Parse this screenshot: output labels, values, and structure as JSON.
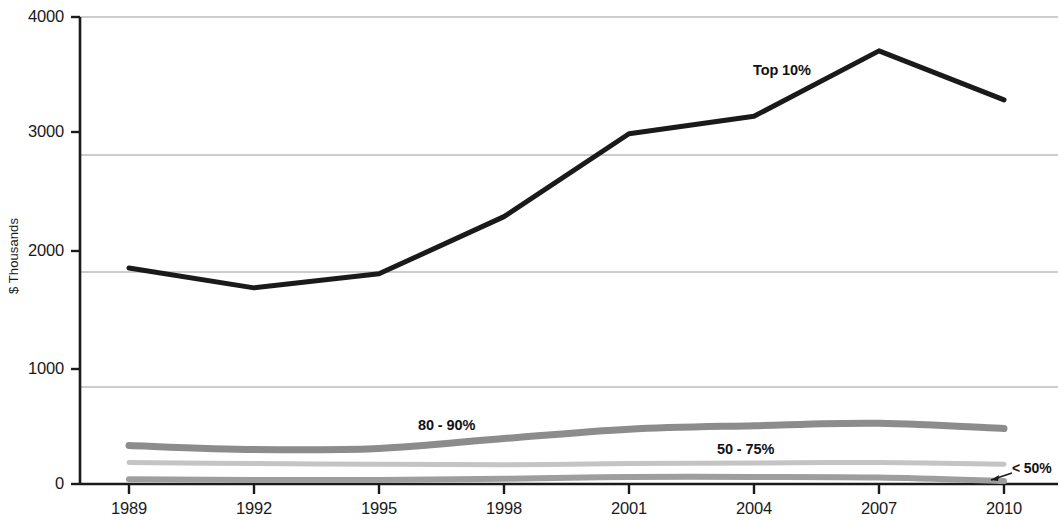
{
  "chart_data": {
    "type": "line",
    "title": "",
    "subtitle": "",
    "xlabel": "",
    "ylabel": "$ Thousands",
    "categories": [
      "1989",
      "1992",
      "1995",
      "1998",
      "2001",
      "2004",
      "2007",
      "2010"
    ],
    "x": [
      1989,
      1992,
      1995,
      1998,
      2001,
      2004,
      2007,
      2010
    ],
    "ylim": [
      0,
      4000
    ],
    "yticks": [
      0,
      1000,
      2000,
      3000,
      4000
    ],
    "ytick_labels": [
      "0",
      "1000",
      "2000",
      "3000",
      "4000"
    ],
    "xtick_labels": [
      "1989",
      "1992",
      "1995",
      "1998",
      "2001",
      "2004",
      "2007",
      "2010"
    ],
    "grid": true,
    "gridlines_y": [
      830,
      1820,
      2820,
      4000
    ],
    "legend": "inline-annotations",
    "legend_position": "inline",
    "series": [
      {
        "name": "Top 10%",
        "color": "#1a1a1a",
        "width": 5,
        "style": "solid",
        "values": [
          1850,
          1680,
          1800,
          2290,
          3000,
          3150,
          3710,
          3290
        ]
      },
      {
        "name": "80 - 90%",
        "color": "#8c8c8c",
        "width": 7,
        "style": "solid",
        "values": [
          330,
          295,
          305,
          390,
          470,
          500,
          520,
          475
        ]
      },
      {
        "name": "50 - 75%",
        "color": "#c4c4c4",
        "width": 5,
        "style": "solid",
        "values": [
          185,
          175,
          170,
          165,
          175,
          180,
          185,
          170
        ]
      },
      {
        "name": "< 50%",
        "color": "#9e9e9e",
        "width": 6,
        "style": "solid",
        "values": [
          40,
          35,
          35,
          45,
          60,
          60,
          55,
          25
        ]
      }
    ],
    "annotations": [
      {
        "text": "Top 10%",
        "series": "Top 10%",
        "x_px": 753,
        "y_px": 63
      },
      {
        "text": "80 - 90%",
        "series": "80 - 90%",
        "x_px": 418,
        "y_px": 418
      },
      {
        "text": "50 - 75%",
        "series": "50 - 75%",
        "x_px": 717,
        "y_px": 442
      },
      {
        "text": "< 50%",
        "series": "< 50%",
        "x_px": 1012,
        "y_px": 461
      }
    ]
  },
  "axis": {
    "y_title": "$ Thousands",
    "y_labels": [
      "4000",
      "3000",
      "2000",
      "1000",
      "0"
    ],
    "x_labels": [
      "1989",
      "1992",
      "1995",
      "1998",
      "2001",
      "2004",
      "2007",
      "2010"
    ]
  },
  "annotations": {
    "top10": "Top 10%",
    "p80_90": "80 - 90%",
    "p50_75": "50 - 75%",
    "under50": "< 50%"
  },
  "colors": {
    "axis": "#1a1a1a",
    "grid": "#9a9a9a",
    "top10": "#1a1a1a",
    "p80_90": "#8c8c8c",
    "p50_75": "#c4c4c4",
    "under50": "#9e9e9e",
    "background": "#ffffff"
  }
}
